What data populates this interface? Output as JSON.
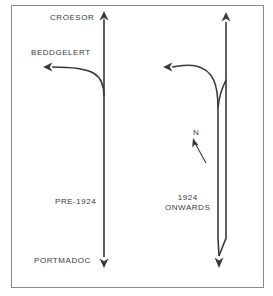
{
  "figure": {
    "title_labels": {
      "croesor": "CROESOR",
      "beddgelert": "BEDDGELERT",
      "portmadoc": "PORTMADOC"
    },
    "captions": {
      "left": "PRE-1924",
      "right_line1": "1924",
      "right_line2": "ONWARDS"
    },
    "compass": {
      "label": "N"
    },
    "colors": {
      "line": "#3a3a3a",
      "frame": "#8a8a8a",
      "background": "#ffffff",
      "text": "#3a3a3a"
    }
  }
}
